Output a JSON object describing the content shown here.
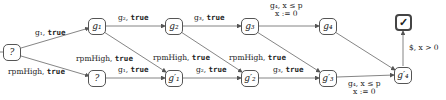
{
  "diagram": {
    "type": "state-automaton",
    "nodes": {
      "start": "?",
      "g1": "g₁",
      "q_low": "?",
      "g2": "g₂",
      "g1p": "g′₁",
      "g3": "g₃",
      "g2p": "g′₂",
      "g4": "g₄",
      "g3p": "g′₃",
      "accept": "✓",
      "g4p": "g′₄"
    },
    "edges": {
      "start_g1": {
        "guard": "g₁, ",
        "cond": "true"
      },
      "start_q": {
        "guard": "rpmHigh, ",
        "cond": "true"
      },
      "g1_g2": {
        "guard": "g₂, ",
        "cond": "true"
      },
      "g1_g1p": {
        "guard": "rpmHigh, ",
        "cond": "true"
      },
      "q_g1p": {
        "guard": "g₁, ",
        "cond": "true"
      },
      "g2_g3": {
        "guard": "g₃, ",
        "cond": "true"
      },
      "g2_g2p": {
        "guard": "rpmHigh, ",
        "cond": "true"
      },
      "g1p_g2p": {
        "guard": "g₂, ",
        "cond": "true"
      },
      "g3_g4": {
        "line1": "g₄, x ≤ p",
        "line2": "x := 0"
      },
      "g3_g3p": {
        "guard": "rpmHigh, ",
        "cond": "true"
      },
      "g2p_g3p": {
        "guard": "g₃, ",
        "cond": "true"
      },
      "g3p_g4p": {
        "line1": "g₄, x ≤ p",
        "line2": "x := 0"
      },
      "g4p_accept": {
        "label": "$, x > 0"
      }
    }
  }
}
